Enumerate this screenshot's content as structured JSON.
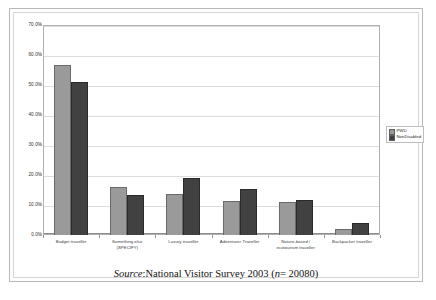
{
  "caption": {
    "source_word": "Source",
    "sep": ": ",
    "survey": "National Visitor Survey 2003 (",
    "n_italic": "n",
    "n_value": " = 20080)"
  },
  "legend": {
    "position": "right",
    "items": [
      {
        "label": "PWD",
        "color": "#9a9a9a"
      },
      {
        "label": "NonDisabled",
        "color": "#414141"
      }
    ]
  },
  "axis": {
    "yticks": [
      "0.0%",
      "10.0%",
      "20.0%",
      "30.0%",
      "40.0%",
      "50.0%",
      "60.0%",
      "70.0%"
    ],
    "ytick_values": [
      0,
      10,
      20,
      30,
      40,
      50,
      60,
      70
    ]
  },
  "chart_data": {
    "type": "bar",
    "title": "",
    "xlabel": "",
    "ylabel": "",
    "ylim": [
      0,
      70
    ],
    "grid": true,
    "legend_position": "right",
    "categories": [
      "Budget traveller",
      "Something else (SPECIFY)",
      "Luxury traveller",
      "Adventurer Traveller",
      "Nature-based / ecotourism traveller",
      "Backpacker traveller"
    ],
    "category_lines": [
      [
        "Budget traveller"
      ],
      [
        "Something else",
        "(SPECIFY)"
      ],
      [
        "Luxury traveller"
      ],
      [
        "Adventurer Traveller"
      ],
      [
        "Nature-based /",
        "ecotourism traveller"
      ],
      [
        "Backpacker traveller"
      ]
    ],
    "series": [
      {
        "name": "PWD",
        "color": "#9a9a9a",
        "values": [
          56.8,
          15.9,
          13.8,
          11.4,
          10.9,
          2.1
        ]
      },
      {
        "name": "NonDisabled",
        "color": "#414141",
        "values": [
          51.0,
          13.3,
          19.0,
          15.3,
          11.8,
          4.1
        ]
      }
    ],
    "units": "percent",
    "source_note": "Source: National Visitor Survey 2003 (n = 20080)"
  }
}
